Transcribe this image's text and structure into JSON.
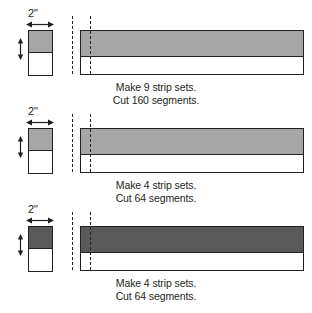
{
  "page": {
    "background_color": "#ffffff",
    "line_color": "#231f20"
  },
  "blocks": [
    {
      "id": "strip-set-1",
      "width_label": "2\"",
      "sample_fill": "#a6a6a6",
      "strip_fill": "#a6a6a6",
      "caption_line1": "Make 9 strip sets.",
      "caption_line2": "Cut 160 segments."
    },
    {
      "id": "strip-set-2",
      "width_label": "2\"",
      "sample_fill": "#a6a6a6",
      "strip_fill": "#a6a6a6",
      "caption_line1": "Make 4 strip sets.",
      "caption_line2": "Cut 64 segments."
    },
    {
      "id": "strip-set-3",
      "width_label": "2\"",
      "sample_fill": "#595959",
      "strip_fill": "#595959",
      "caption_line1": "Make 4 strip sets.",
      "caption_line2": "Cut 64 segments."
    }
  ],
  "icons": {
    "width_arrow": "double-headed-horizontal-arrow",
    "height_arrow": "double-headed-vertical-arrow",
    "cut_line": "dashed-cut-line"
  }
}
